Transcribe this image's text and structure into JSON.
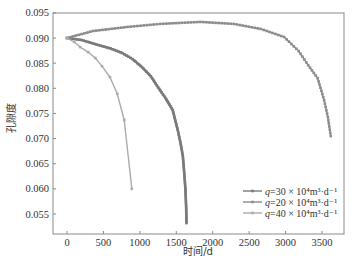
{
  "chart_data": {
    "type": "line",
    "title": "",
    "xlabel": "时间/d",
    "ylabel": "孔隙度",
    "xlim": [
      -100,
      3850
    ],
    "ylim": [
      0.051,
      0.095
    ],
    "x_ticks": [
      0,
      500,
      1000,
      1500,
      2000,
      2500,
      3000,
      3500
    ],
    "x_tick_labels": [
      "0",
      "500",
      "1000",
      "1500",
      "2000",
      "2500",
      "3000",
      "3500"
    ],
    "y_ticks": [
      0.055,
      0.06,
      0.065,
      0.07,
      0.075,
      0.08,
      0.085,
      0.09,
      0.095
    ],
    "y_tick_labels": [
      "0.055",
      "0.060",
      "0.065",
      "0.070",
      "0.075",
      "0.080",
      "0.085",
      "0.090",
      "0.095"
    ],
    "grid": false,
    "legend_position": "lower right",
    "series": [
      {
        "name": "q=30×10⁴m³·d⁻¹",
        "legend_q": "q",
        "legend_rest": "=30 × 10⁴m³·d⁻¹",
        "color": "#7a7a7a",
        "marker_every_px": 2,
        "x": [
          0,
          200,
          430,
          600,
          760,
          900,
          1030,
          1150,
          1250,
          1350,
          1450,
          1520,
          1560,
          1590,
          1610,
          1625,
          1635,
          1640
        ],
        "y": [
          0.09,
          0.0896,
          0.0886,
          0.0879,
          0.087,
          0.0858,
          0.0842,
          0.0824,
          0.0802,
          0.0781,
          0.0757,
          0.0717,
          0.069,
          0.0665,
          0.063,
          0.06,
          0.0565,
          0.0532
        ]
      },
      {
        "name": "q=20×10⁴m³·d⁻¹",
        "legend_q": "q",
        "legend_rest": "=20 × 10⁴m³·d⁻¹",
        "color": "#8c8c8c",
        "marker_every_px": 3,
        "x": [
          0,
          360,
          830,
          1280,
          1830,
          2290,
          2660,
          2980,
          3180,
          3310,
          3440,
          3530,
          3580,
          3620
        ],
        "y": [
          0.09,
          0.0914,
          0.0922,
          0.0928,
          0.0932,
          0.0928,
          0.0918,
          0.0902,
          0.0874,
          0.0846,
          0.082,
          0.0776,
          0.0743,
          0.0705
        ]
      },
      {
        "name": "q=40×10⁴m³·d⁻¹",
        "legend_q": "q",
        "legend_rest": "=40 × 10⁴m³·d⁻¹",
        "color": "#ababab",
        "marker_every_px": 0,
        "x": [
          0,
          100,
          180,
          290,
          390,
          480,
          590,
          690,
          785,
          890
        ],
        "y": [
          0.09,
          0.0892,
          0.0882,
          0.0872,
          0.086,
          0.0844,
          0.0822,
          0.0789,
          0.0737,
          0.06
        ]
      }
    ]
  }
}
